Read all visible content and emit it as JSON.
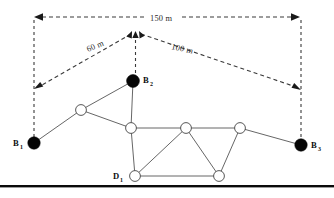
{
  "figure": {
    "background_color": "#ffffff",
    "width": 334,
    "height": 198
  },
  "dimensions": [
    {
      "id": "span-total",
      "label": "150 m",
      "label_x": 153,
      "label_y": 19,
      "orientation": "horizontal",
      "from_x": 34,
      "from_y": 17,
      "to_x": 300,
      "to_y": 17
    },
    {
      "id": "span-left",
      "label": "60 m",
      "label_x": 88,
      "label_y": 50,
      "rotation": -22,
      "orientation": "diagonal",
      "from_x": 136,
      "from_y": 32,
      "to_x": 36,
      "to_y": 88
    },
    {
      "id": "span-right",
      "label": "100 m",
      "label_x": 172,
      "label_y": 47,
      "rotation": 12,
      "orientation": "diagonal",
      "from_x": 137,
      "from_y": 32,
      "to_x": 299,
      "to_y": 89
    }
  ],
  "guides": [
    {
      "id": "guide-left-vertical",
      "x1": 34,
      "y1": 17,
      "x2": 34,
      "y2": 141
    },
    {
      "id": "guide-right-vertical",
      "x1": 301,
      "y1": 17,
      "x2": 301,
      "y2": 143
    },
    {
      "id": "guide-apex-vertical",
      "x1": 135,
      "y1": 33,
      "x2": 135,
      "y2": 79
    }
  ],
  "nodes": {
    "stations": [
      {
        "id": "B1",
        "label": "B",
        "subscript": "1",
        "x": 34,
        "y": 143,
        "r": 6.2,
        "type": "filled",
        "label_x": 14,
        "label_y": 146,
        "sub_x": 21,
        "sub_y": 149
      },
      {
        "id": "B2",
        "label": "B",
        "subscript": "2",
        "x": 133,
        "y": 81,
        "r": 6.4,
        "type": "filled",
        "label_x": 143,
        "label_y": 82,
        "sub_x": 150,
        "sub_y": 85
      },
      {
        "id": "B3",
        "label": "B",
        "subscript": "3",
        "x": 301,
        "y": 145,
        "r": 6.2,
        "type": "filled",
        "label_x": 311,
        "label_y": 148,
        "sub_x": 318,
        "sub_y": 151
      }
    ],
    "points": [
      {
        "id": "P-upper-left",
        "x": 81,
        "y": 110,
        "r": 5.4,
        "type": "open"
      },
      {
        "id": "P-center",
        "x": 131,
        "y": 128,
        "r": 5.4,
        "type": "open"
      },
      {
        "id": "P-mid-right",
        "x": 186,
        "y": 128,
        "r": 5.4,
        "type": "open"
      },
      {
        "id": "P-right",
        "x": 240,
        "y": 128,
        "r": 5.4,
        "type": "open"
      },
      {
        "id": "D1",
        "label": "D",
        "subscript": "1",
        "x": 135,
        "y": 176,
        "r": 5.4,
        "type": "open",
        "label_x": 114,
        "label_y": 179,
        "sub_x": 121,
        "sub_y": 182
      },
      {
        "id": "P-bottom-right",
        "x": 219,
        "y": 176,
        "r": 5.4,
        "type": "open"
      }
    ]
  },
  "edges": [
    {
      "from": "B1",
      "to": "P-upper-left"
    },
    {
      "from": "P-upper-left",
      "to": "B2"
    },
    {
      "from": "P-upper-left",
      "to": "P-center"
    },
    {
      "from": "B2",
      "to": "P-center"
    },
    {
      "from": "P-center",
      "to": "P-mid-right"
    },
    {
      "from": "P-center",
      "to": "D1"
    },
    {
      "from": "P-mid-right",
      "to": "P-right"
    },
    {
      "from": "P-mid-right",
      "to": "D1"
    },
    {
      "from": "P-mid-right",
      "to": "P-bottom-right"
    },
    {
      "from": "P-right",
      "to": "P-bottom-right"
    },
    {
      "from": "P-right",
      "to": "B3"
    },
    {
      "from": "D1",
      "to": "P-bottom-right"
    }
  ],
  "baseline": {
    "id": "ground-rule",
    "x": 0,
    "y": 185,
    "width": 334,
    "height": 2.4,
    "color": "#0a0a0a"
  },
  "colors": {
    "node_fill": "#050505",
    "node_stroke": "#444444",
    "edge": "#555555",
    "dimension": "#3a3a3a",
    "text": "#0d0d0d",
    "background": "#ffffff"
  }
}
